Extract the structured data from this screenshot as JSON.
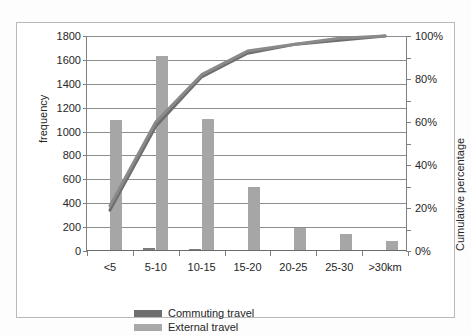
{
  "chart_data": {
    "type": "bar",
    "title": "",
    "subtitle": "",
    "xlabel": "",
    "ylabel": "frequency",
    "ylabel_secondary": "Cumulative percentage",
    "categories": [
      "<5",
      "5-10",
      "10-15",
      "15-20",
      "20-25",
      "25-30",
      ">30km"
    ],
    "ylim": [
      0,
      1800
    ],
    "ylim_secondary": [
      0,
      100
    ],
    "yticks": [
      0,
      200,
      400,
      600,
      800,
      1000,
      1200,
      1400,
      1600,
      1800
    ],
    "ytick_labels": [
      "0",
      "200",
      "400",
      "600",
      "800",
      "1000",
      "1200",
      "1400",
      "1600",
      "1800"
    ],
    "yticks_secondary": [
      0,
      10,
      20,
      30,
      40,
      50,
      60,
      70,
      80,
      90,
      100
    ],
    "ytick_labels_secondary": [
      "0%",
      "",
      "20%",
      "",
      "40%",
      "",
      "60%",
      "",
      "80%",
      "",
      "100%"
    ],
    "grid": true,
    "legend_position": "bottom",
    "series": [
      {
        "name": "Commuting travel",
        "kind": "bar",
        "color": "#7b7b7b",
        "axis": "left",
        "values": [
          12,
          28,
          14,
          0,
          0,
          0,
          0
        ]
      },
      {
        "name": "External travel",
        "kind": "bar",
        "color": "#a6a6a6",
        "axis": "left",
        "values": [
          1100,
          1630,
          1105,
          540,
          190,
          145,
          80
        ]
      },
      {
        "name": "Commuting travel cumulative",
        "kind": "line",
        "color": "#6e6e6e",
        "axis": "right",
        "values": [
          19,
          58,
          81,
          92,
          96,
          98,
          100
        ]
      },
      {
        "name": "External travel cumulative",
        "kind": "line",
        "color": "#8a8a8a",
        "axis": "right",
        "values": [
          21,
          60,
          82,
          93,
          96,
          99,
          100
        ]
      }
    ]
  },
  "axes": {
    "left_title": "frequency",
    "right_title": "Cumulative percentage",
    "left_ticks": [
      "1800",
      "1600",
      "1400",
      "1200",
      "1000",
      "800",
      "600",
      "400",
      "200",
      "0"
    ],
    "right_ticks": [
      "100%",
      "80%",
      "60%",
      "40%",
      "20%",
      "0%"
    ],
    "category_labels": [
      "<5",
      "5-10",
      "10-15",
      "15-20",
      "20-25",
      "25-30",
      ">30km"
    ]
  },
  "legend": {
    "items": [
      {
        "label": "Commuting travel",
        "color": "#6e6e6e"
      },
      {
        "label": "External travel",
        "color": "#a8a8a8"
      }
    ]
  }
}
